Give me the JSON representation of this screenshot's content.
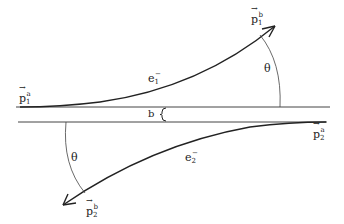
{
  "diagram": {
    "labels": {
      "p1_initial": {
        "base": "p",
        "sub": "1",
        "sup": "a"
      },
      "p1_final": {
        "base": "p",
        "sub": "1",
        "sup": "b"
      },
      "p2_initial": {
        "base": "p",
        "sub": "2",
        "sup": "a"
      },
      "p2_final": {
        "base": "p",
        "sub": "2",
        "sup": "b"
      },
      "e1": {
        "base": "e",
        "sub": "1",
        "sup": "−"
      },
      "e2": {
        "base": "e",
        "sub": "2",
        "sup": "−"
      },
      "theta_upper": "θ",
      "theta_lower": "θ",
      "impact_parameter": "b"
    },
    "colors": {
      "stroke": "#222222",
      "background": "#ffffff"
    }
  }
}
